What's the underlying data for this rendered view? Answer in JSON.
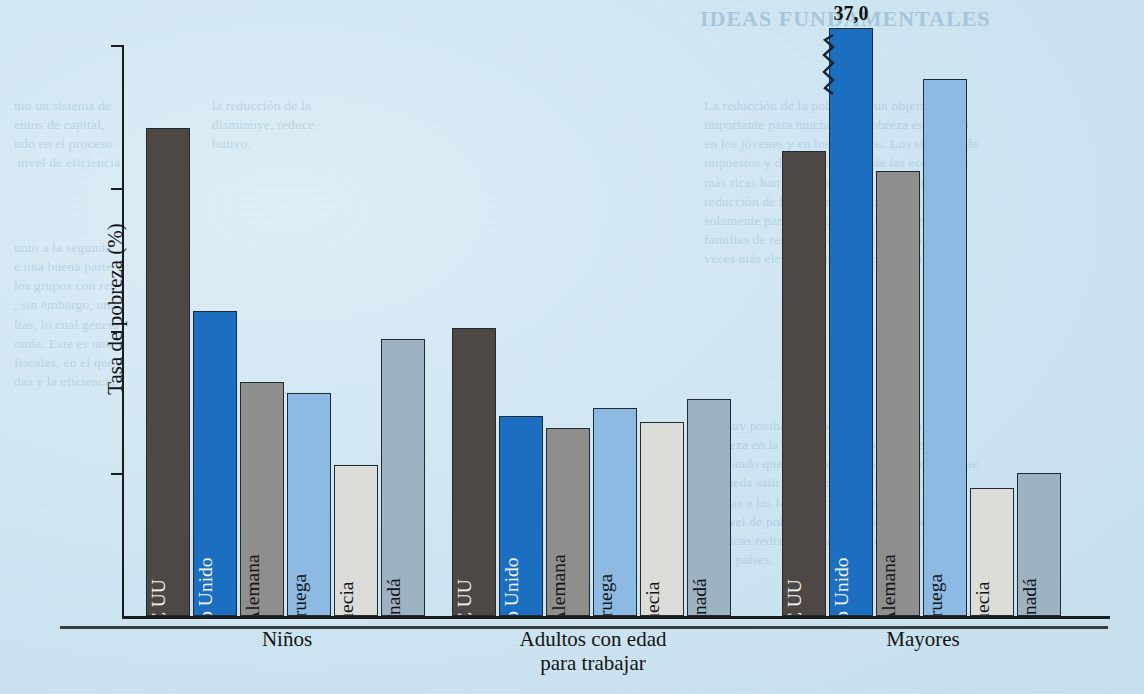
{
  "chart_data": {
    "type": "bar",
    "title": "",
    "xlabel": "",
    "ylabel": "Tasa de pobreza (%)",
    "ylim": [
      0,
      20
    ],
    "yticks": [
      "5",
      "10",
      "15",
      "20"
    ],
    "ytick_values": [
      5,
      10,
      15,
      20
    ],
    "grid": false,
    "legend": "none",
    "categories": [
      "Niños",
      "Adultos con edad\npara trabajar",
      "Mayores"
    ],
    "series": [
      {
        "name": "EE UU",
        "color": "#4d4844",
        "values": [
          17.1,
          10.1,
          16.3
        ]
      },
      {
        "name": "Reino Unido",
        "color": "#1b6ec0",
        "values": [
          10.7,
          7.0,
          37.0
        ]
      },
      {
        "name": "R.F. Alemana",
        "color": "#8e8e8c",
        "values": [
          8.2,
          6.6,
          15.6
        ]
      },
      {
        "name": "Noruega",
        "color": "#8cbae2",
        "values": [
          7.8,
          7.3,
          18.8
        ]
      },
      {
        "name": "Suecia",
        "color": "#dcdcd8",
        "values": [
          5.3,
          6.8,
          4.5
        ]
      },
      {
        "name": "Canadá",
        "color": "#9db2c3",
        "values": [
          9.7,
          7.6,
          5.0
        ]
      }
    ],
    "annotations": [
      {
        "text": "37,0",
        "series": "Reino Unido",
        "category": "Mayores",
        "note": "bar is truncated with an axis-break squiggle"
      }
    ]
  },
  "axis": {
    "y_label": "Tasa de pobreza (%)",
    "ticks": [
      {
        "label": "20",
        "value": 20
      },
      {
        "label": "15",
        "value": 15
      },
      {
        "label": "10",
        "value": 10
      },
      {
        "label": "5",
        "value": 5
      }
    ]
  },
  "groups": [
    {
      "label": "Niños",
      "bars": [
        {
          "country": "EE UU",
          "value": 17.1,
          "label_on": "dark"
        },
        {
          "country": "Reino Unido",
          "value": 10.7,
          "label_on": "dark"
        },
        {
          "country": "R.F. Alemana",
          "value": 8.2,
          "label_on": "light"
        },
        {
          "country": "Noruega",
          "value": 7.8,
          "label_on": "light"
        },
        {
          "country": "Suecia",
          "value": 5.3,
          "label_on": "light"
        },
        {
          "country": "Canadá",
          "value": 9.7,
          "label_on": "light"
        }
      ]
    },
    {
      "label": "Adultos con edad\npara trabajar",
      "bars": [
        {
          "country": "EE UU",
          "value": 10.1,
          "label_on": "dark"
        },
        {
          "country": "Reino Unido",
          "value": 7.0,
          "label_on": "dark"
        },
        {
          "country": "R.F. Alemana",
          "value": 6.6,
          "label_on": "light"
        },
        {
          "country": "Noruega",
          "value": 7.3,
          "label_on": "light"
        },
        {
          "country": "Suecia",
          "value": 6.8,
          "label_on": "light"
        },
        {
          "country": "Canadá",
          "value": 7.6,
          "label_on": "light"
        }
      ]
    },
    {
      "label": "Mayores",
      "bars": [
        {
          "country": "EE UU",
          "value": 16.3,
          "label_on": "dark"
        },
        {
          "country": "Reino Unido",
          "value": 37.0,
          "label_on": "dark",
          "value_label": "37,0",
          "broken": true
        },
        {
          "country": "R.F. Alemana",
          "value": 15.6,
          "label_on": "light"
        },
        {
          "country": "Noruega",
          "value": 18.8,
          "label_on": "light"
        },
        {
          "country": "Suecia",
          "value": 4.5,
          "label_on": "light"
        },
        {
          "country": "Canadá",
          "value": 5.0,
          "label_on": "light"
        }
      ]
    }
  ],
  "colors": {
    "ee_uu": "#4d4844",
    "reino_unido": "#1b6ec0",
    "rf_alemana": "#8e8e8c",
    "noruega": "#8cbae2",
    "suecia": "#dcdcd8",
    "canada": "#9db2c3",
    "background": "#cfe6f2",
    "ink": "#1b1b1b"
  },
  "bleed_text": {
    "heading_right": "IDEAS FUNDAMENTALES",
    "col_left_top": "mo un sistema de\nentos de capital,\nndo en el proceso\n nivel de eficiencia.",
    "col_left_mid": "unto a la segunda\ne una buena parte\nlos grupos con ren-\n, sin embargo, una\nltas, lo cual genera\nomía. Este es uno\nfiscales, en el que\ndas y la eficiencia.",
    "col_mid_top": "la reducción de la\ndisminuye, reduce\nbutivo.",
    "col_right_top": "La reducción de la pobreza es un objetivo\nimportante para muchos. La pobreza es extensa\nen los jóvenes y en los ancianos. Los sistemas de\nimpuestos y de transferencias de las economías\nmás ricas han tenido un efecto importante en la\nreducción de la pobreza, aunque en EE UU\nsolamente para los ancianos. La pobreza en\nfamilias de renta baja en EE UU es hasta 3 o 4\nveces más elevada que en los países europeos.",
    "col_right_low": "Es muy posible que exista una relación entre\npobreza en la infancia y la pobreza más tarde,\nindicando que la pobreza no es un estado del que\nse pueda salir fácilmente. Los programas de\nayudas a las familias con niños pueden reducir\nel nivel de pobreza en los países europeos. Las\npolíticas redistributivas son fundamentales en\nestos países."
  }
}
